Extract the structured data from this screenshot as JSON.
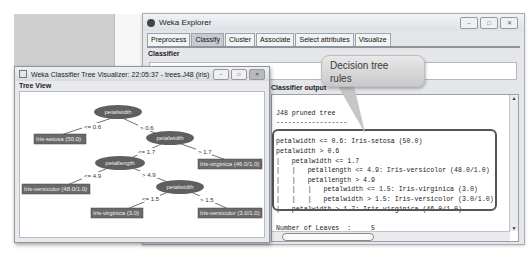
{
  "explorer": {
    "title": "Weka Explorer",
    "window_buttons": [
      "minimize",
      "maximize",
      "close"
    ],
    "tabs": [
      {
        "label": "Preprocess",
        "active": false
      },
      {
        "label": "Classify",
        "active": true
      },
      {
        "label": "Cluster",
        "active": false
      },
      {
        "label": "Associate",
        "active": false
      },
      {
        "label": "Select attributes",
        "active": false
      },
      {
        "label": "Visualize",
        "active": false
      }
    ],
    "classifier_label": "Classifier",
    "output_label": "Classifier output",
    "output_lines": [
      "J48 pruned tree",
      "------------------",
      "",
      "petalwidth <= 0.6: Iris-setosa (50.0)",
      "petalwidth > 0.6",
      "|   petalwidth <= 1.7",
      "|   |   petallength <= 4.9: Iris-versicolor (48.0/1.0)",
      "|   |   petallength > 4.9",
      "|   |   |   petalwidth <= 1.5: Iris-virginica (3.0)",
      "|   |   |   petalwidth > 1.5: Iris-versicolor (3.0/1.0)",
      "|   petalwidth > 1.7: Iris-virginica (46.0/1.0)",
      "",
      "Number of Leaves  :     5"
    ]
  },
  "callout": {
    "line1": "Decision tree",
    "line2": "rules"
  },
  "tree_window": {
    "title": "Weka Classifier Tree Visualizer: 22:05:37 - trees.J48 (iris)",
    "panel_label": "Tree View",
    "nodes": {
      "root": "petalwidth",
      "n2": "petalwidth",
      "n3": "petallength",
      "n4": "petalwidth"
    },
    "leaves": {
      "setosa": "Iris-setosa (50.0)",
      "virginica46": "Iris-virginica (46.0/1.0)",
      "versicolor48": "Iris-versicolor (48.0/1.0)",
      "virginica3": "Iris-virginica (3.0)",
      "versicolor3": "Iris-versicolor (3.0/1.0)"
    },
    "edges": {
      "e1": "<= 0.6",
      "e2": "> 0.6",
      "e3": "<= 1.7",
      "e4": "> 1.7",
      "e5": "<= 4.9",
      "e6": "> 4.9",
      "e7": "<= 1.5",
      "e8": "> 1.5"
    }
  },
  "colors": {
    "node_fill": "#5f5f5f",
    "leaf_fill": "#6a6a6a",
    "window_bg": "#e4e6ea"
  }
}
